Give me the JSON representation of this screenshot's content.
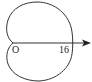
{
  "diagram": {
    "type": "polar-curve-cardioid",
    "labels": {
      "origin": "O",
      "axis_value": "16"
    },
    "colors": {
      "stroke": "#333333",
      "background": "#ffffff"
    }
  }
}
